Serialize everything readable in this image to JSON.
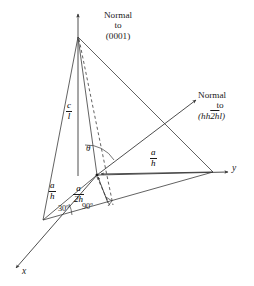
{
  "figure": {
    "title_text": "",
    "background_color": "#ffffff",
    "line_color": "#3a3a3a",
    "text_color": "#1a1a1a"
  },
  "axes": {
    "x_label": "x",
    "y_label": "y",
    "vertical_axis_is_normal_0001": true
  },
  "normals": [
    {
      "id": "normal-0001",
      "line1": "Normal",
      "line2": "to",
      "line3": "(0001)"
    },
    {
      "id": "normal-hh2hl",
      "line1": "Normal",
      "line2": "to",
      "index_open": "(",
      "index_hh": "hh",
      "index_2h_overbar": "2h",
      "index_l": "l",
      "index_close": ")",
      "line3_plain": "(hh2hl)"
    }
  ],
  "dimension_labels": [
    {
      "id": "c-over-l",
      "numerator": "c",
      "denominator": "l"
    },
    {
      "id": "a-over-h-right",
      "numerator": "a",
      "denominator": "h"
    },
    {
      "id": "a-over-h-left",
      "numerator": "a",
      "denominator": "h"
    },
    {
      "id": "a-over-2h",
      "numerator": "a",
      "denominator": "2h"
    }
  ],
  "angle_labels": [
    {
      "id": "angle-theta",
      "text": "θ"
    },
    {
      "id": "angle-30",
      "text": "30º"
    },
    {
      "id": "angle-90",
      "text": "90º"
    }
  ]
}
